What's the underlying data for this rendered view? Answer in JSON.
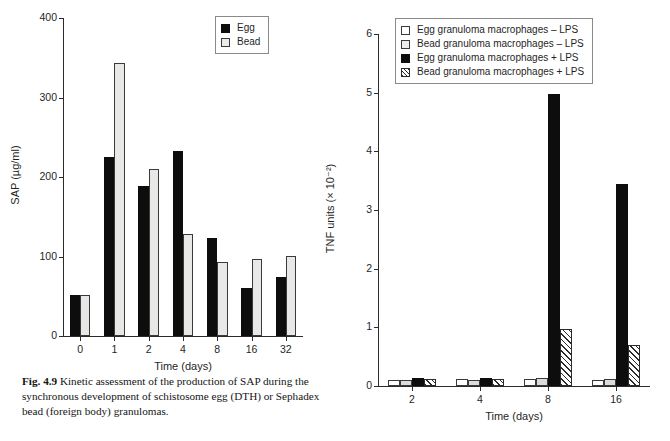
{
  "figure": {
    "caption_label": "Fig. 4.9",
    "caption_text": "Kinetic assessment of the production of SAP during the synchronous development of schistosome egg (DTH) or Sephadex bead (foreign body) granulomas."
  },
  "chart_data": [
    {
      "type": "bar",
      "id": "sap-kinetics",
      "title": "",
      "xlabel": "Time (days)",
      "ylabel": "SAP (µg/ml)",
      "categories": [
        "0",
        "1",
        "2",
        "4",
        "8",
        "16",
        "32"
      ],
      "ylim": [
        0,
        400
      ],
      "yticks": [
        0,
        100,
        200,
        300,
        400
      ],
      "ytick_labels": [
        "0",
        "100",
        "200",
        "300",
        "400"
      ],
      "grid": false,
      "legend_position": "top-right",
      "series": [
        {
          "name": "Egg",
          "style": "solid-black",
          "values": [
            52,
            225,
            189,
            233,
            123,
            60,
            74
          ]
        },
        {
          "name": "Bead",
          "style": "open-light",
          "values": [
            52,
            344,
            210,
            128,
            93,
            97,
            101
          ]
        }
      ]
    },
    {
      "type": "bar",
      "id": "tnf-units",
      "title": "",
      "xlabel": "Time (days)",
      "ylabel": "TNF units (× 10⁻²)",
      "categories": [
        "2",
        "4",
        "8",
        "16"
      ],
      "ylim": [
        0,
        6
      ],
      "yticks": [
        0,
        1,
        2,
        3,
        4,
        5,
        6
      ],
      "ytick_labels": [
        "0",
        "1",
        "2",
        "3",
        "4",
        "5",
        "6"
      ],
      "grid": false,
      "legend_position": "top-right",
      "series": [
        {
          "name": "Egg granuloma macrophages – LPS",
          "style": "open",
          "values": [
            0.1,
            0.12,
            0.12,
            0.11
          ]
        },
        {
          "name": "Bead granuloma macrophages – LPS",
          "style": "gray",
          "values": [
            0.1,
            0.11,
            0.13,
            0.12
          ]
        },
        {
          "name": "Egg granuloma macrophages + LPS",
          "style": "solid",
          "values": [
            0.13,
            0.14,
            4.97,
            3.45
          ]
        },
        {
          "name": "Bead granuloma macrophages + LPS",
          "style": "hatch",
          "values": [
            0.12,
            0.12,
            0.97,
            0.7
          ]
        }
      ]
    }
  ]
}
